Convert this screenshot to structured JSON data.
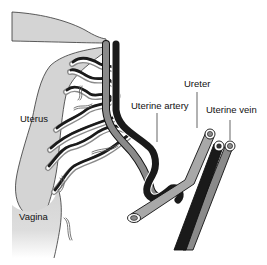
{
  "diagram": {
    "labels": {
      "uterus": "Uterus",
      "vagina": "Vagina",
      "uterine_artery": "Uterine artery",
      "ureter": "Ureter",
      "uterine_vein": "Uterine vein"
    },
    "colors": {
      "organ_fill": "#d4d4d4",
      "organ_stroke": "#333333",
      "artery_fill": "#1a1a1a",
      "vein_fill": "#8a8a8a",
      "ureter_fill": "#a8a8a8",
      "outline": "#111111"
    }
  }
}
